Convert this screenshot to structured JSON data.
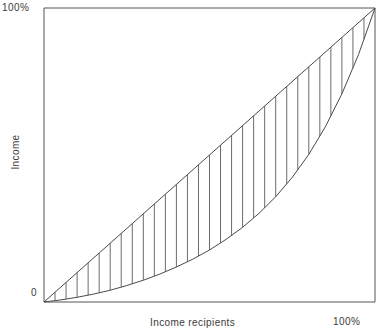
{
  "chart_data": {
    "type": "line",
    "title": "",
    "subtitle": "",
    "xlabel": "Income recipients",
    "ylabel": "Income",
    "xlim": [
      0,
      100
    ],
    "ylim": [
      0,
      100
    ],
    "grid": false,
    "legend": null,
    "axis_labels": {
      "y_max": "100%",
      "y_min": "0",
      "x_max": "100%"
    },
    "series": [
      {
        "name": "Line of equality",
        "style": "straight-diagonal",
        "x": [
          0,
          100
        ],
        "values": [
          0,
          100
        ]
      },
      {
        "name": "Lorenz curve",
        "style": "convex-curve",
        "x": [
          0,
          5,
          10,
          15,
          20,
          25,
          30,
          35,
          40,
          45,
          50,
          55,
          60,
          65,
          70,
          75,
          80,
          85,
          90,
          95,
          100
        ],
        "values": [
          0,
          0.7,
          1.6,
          2.7,
          4.0,
          5.6,
          7.4,
          9.5,
          11.9,
          14.6,
          17.7,
          21.3,
          25.4,
          30.2,
          35.8,
          42.4,
          50.2,
          59.6,
          70.8,
          84.1,
          100
        ]
      }
    ],
    "annotations": {
      "shaded_region": "vertical hatching between line of equality and Lorenz curve",
      "hatch_line_count": 29
    }
  },
  "colors": {
    "axis": "#555555",
    "curve": "#4a4a4a",
    "hatch": "#6b6b6b",
    "text": "#3a3a3a",
    "background": "#ffffff"
  }
}
